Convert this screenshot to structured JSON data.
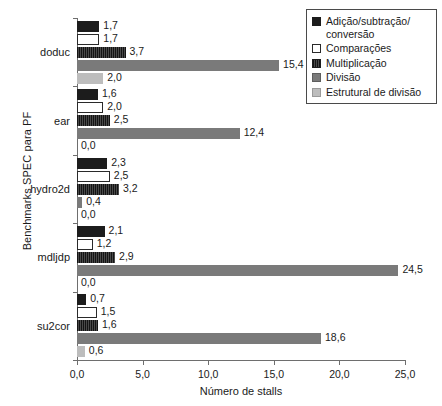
{
  "chart_data": {
    "type": "bar",
    "orientation": "horizontal",
    "title": "",
    "xlabel": "Número de stalls",
    "ylabel": "Benchmarks SPEC para PF",
    "xlim": [
      0.0,
      25.0
    ],
    "xticks": [
      "0,0",
      "5,0",
      "10,0",
      "15,0",
      "20,0",
      "25,0"
    ],
    "xtick_values": [
      0.0,
      5.0,
      10.0,
      15.0,
      20.0,
      25.0
    ],
    "grid": false,
    "legend_position": "top-right",
    "categories": [
      "doduc",
      "ear",
      "hydro2d",
      "mdljdp",
      "su2cor"
    ],
    "series": [
      {
        "name": "Adição/subtração/ conversão",
        "color": "#1c1c1c",
        "values": [
          1.7,
          1.6,
          2.3,
          2.1,
          0.7
        ],
        "labels": [
          "1,7",
          "1,6",
          "2,3",
          "2,1",
          "0,7"
        ]
      },
      {
        "name": "Comparações",
        "color": "#ffffff",
        "values": [
          1.7,
          2.0,
          2.5,
          1.2,
          1.5
        ],
        "labels": [
          "1,7",
          "2,0",
          "2,5",
          "1,2",
          "1,5"
        ]
      },
      {
        "name": "Multiplicação",
        "color": "#2e2e2e",
        "values": [
          3.7,
          2.5,
          3.2,
          2.9,
          1.6
        ],
        "labels": [
          "3,7",
          "2,5",
          "3,2",
          "2,9",
          "1,6"
        ]
      },
      {
        "name": "Divisão",
        "color": "#7a7a7a",
        "values": [
          15.4,
          12.4,
          0.4,
          24.5,
          18.6
        ],
        "labels": [
          "15,4",
          "12,4",
          "0,4",
          "24,5",
          "18,6"
        ]
      },
      {
        "name": "Estrutural de divisão",
        "color": "#bdbdbd",
        "values": [
          2.0,
          0.0,
          0.0,
          0.0,
          0.6
        ],
        "labels": [
          "2,0",
          "0,0",
          "0,0",
          "0,0",
          "0,6"
        ]
      }
    ]
  },
  "legend": {
    "items": [
      {
        "label": "Adição/subtração/ conversão",
        "swatch": "legend-swatch-adicao"
      },
      {
        "label": "Comparações",
        "swatch": "legend-swatch-comparacoes"
      },
      {
        "label": "Multiplicação",
        "swatch": "legend-swatch-multiplicacao"
      },
      {
        "label": "Divisão",
        "swatch": "legend-swatch-divisao"
      },
      {
        "label": "Estrutural de divisão",
        "swatch": "legend-swatch-estrutural"
      }
    ]
  },
  "axes": {
    "x_title": "Número de stalls",
    "y_title": "Benchmarks SPEC para PF"
  }
}
